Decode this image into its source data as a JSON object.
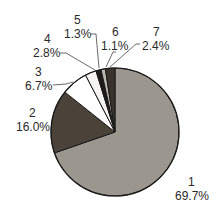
{
  "chart_data": {
    "type": "pie",
    "title": "",
    "categories": [
      "1",
      "2",
      "3",
      "4",
      "5",
      "6",
      "7"
    ],
    "values": [
      69.7,
      16.0,
      6.7,
      2.8,
      1.3,
      1.1,
      2.4
    ],
    "value_labels": [
      "69.7%",
      "16.0%",
      "6.7%",
      "2.8%",
      "1.3%",
      "1.1%",
      "2.4%"
    ],
    "colors": [
      "#9b978f",
      "#4b423a",
      "#ffffff",
      "#f4f3f0",
      "#1e1a17",
      "#b9b5ad",
      "#3a332d"
    ],
    "start_angle_deg": 0,
    "direction": "clockwise",
    "legend": "none",
    "label_style": "category number above percentage, leader lines for small slices"
  },
  "labels": [
    {
      "cat": "1",
      "pct": "69.7%"
    },
    {
      "cat": "2",
      "pct": "16.0%"
    },
    {
      "cat": "3",
      "pct": "6.7%"
    },
    {
      "cat": "4",
      "pct": "2.8%"
    },
    {
      "cat": "5",
      "pct": "1.3%"
    },
    {
      "cat": "6",
      "pct": "1.1%"
    },
    {
      "cat": "7",
      "pct": "2.4%"
    }
  ]
}
